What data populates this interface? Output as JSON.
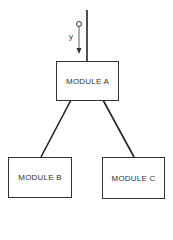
{
  "diagram": {
    "type": "module hierarchy",
    "nodes": [
      {
        "id": "A",
        "label": "MODULE A"
      },
      {
        "id": "B",
        "label": "MODULE B"
      },
      {
        "id": "C",
        "label": "MODULE C"
      }
    ],
    "edges": [
      {
        "from": "A",
        "to": "B"
      },
      {
        "from": "A",
        "to": "C"
      }
    ],
    "input": {
      "label": "y",
      "description": "data flag passed into MODULE A"
    }
  }
}
